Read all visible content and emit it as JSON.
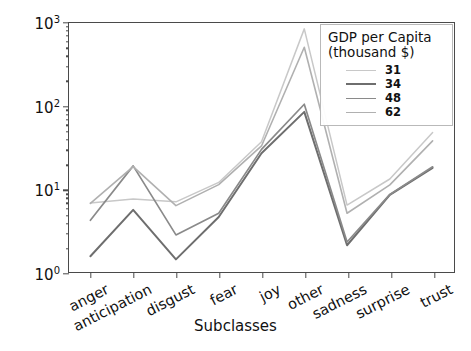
{
  "chart_data": {
    "type": "line",
    "title": "",
    "xlabel": "Subclasses",
    "ylabel": "Number of contributions (log)",
    "yscale": "log",
    "ylim": [
      1,
      1000
    ],
    "ytick_labels": [
      "10^0",
      "10^1",
      "10^2",
      "10^3"
    ],
    "ytick_values": [
      1,
      10,
      100,
      1000
    ],
    "grid": false,
    "legend_position": "upper right",
    "legend_title_line1": "GDP per Capita",
    "legend_title_line2": "(thousand $)",
    "categories": [
      "anger",
      "anticipation",
      "disgust",
      "fear",
      "joy",
      "other",
      "sadness",
      "surprise",
      "trust"
    ],
    "series": [
      {
        "name": "31",
        "color": "#c8c8c8",
        "width": 1.5,
        "values": [
          6.8,
          7.6,
          7.0,
          12.0,
          37.0,
          850.0,
          6.4,
          13.2,
          48.0
        ]
      },
      {
        "name": "34",
        "color": "#6e6e6e",
        "width": 2.0,
        "values": [
          1.55,
          5.6,
          1.42,
          4.6,
          27.0,
          85.0,
          2.1,
          8.5,
          18.0
        ]
      },
      {
        "name": "48",
        "color": "#8a8a8a",
        "width": 1.7,
        "values": [
          4.2,
          19.0,
          2.8,
          5.1,
          30.0,
          105.0,
          2.3,
          8.6,
          18.5
        ]
      },
      {
        "name": "62",
        "color": "#b0b0b0",
        "width": 1.6,
        "values": [
          6.7,
          18.6,
          6.3,
          11.3,
          33.0,
          510.0,
          5.1,
          11.2,
          38.0
        ]
      }
    ]
  },
  "axis": {
    "x_title": "Subclasses"
  }
}
